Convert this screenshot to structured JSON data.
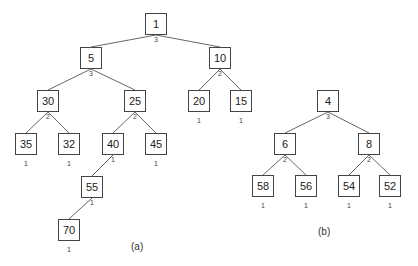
{
  "figures": [
    {
      "id": "a",
      "caption": "(a)",
      "caption_pos": [
        131,
        241
      ],
      "nodes": [
        {
          "key": "1",
          "rank": "3",
          "x": 145,
          "y": 13,
          "rank_pos": "below"
        },
        {
          "key": "5",
          "rank": "3",
          "x": 80,
          "y": 47,
          "rank_pos": "below"
        },
        {
          "key": "10",
          "rank": "2",
          "x": 209,
          "y": 47,
          "rank_pos": "below"
        },
        {
          "key": "30",
          "rank": "2",
          "x": 37,
          "y": 90,
          "rank_pos": "below"
        },
        {
          "key": "25",
          "rank": "2",
          "x": 124,
          "y": 90,
          "rank_pos": "below"
        },
        {
          "key": "20",
          "rank": "1",
          "x": 188,
          "y": 90,
          "rank_pos": "under"
        },
        {
          "key": "15",
          "rank": "1",
          "x": 230,
          "y": 90,
          "rank_pos": "under"
        },
        {
          "key": "35",
          "rank": "1",
          "x": 15,
          "y": 133,
          "rank_pos": "under"
        },
        {
          "key": "32",
          "rank": "1",
          "x": 58,
          "y": 133,
          "rank_pos": "under"
        },
        {
          "key": "40",
          "rank": "1",
          "x": 102,
          "y": 133,
          "rank_pos": "below"
        },
        {
          "key": "45",
          "rank": "1",
          "x": 145,
          "y": 133,
          "rank_pos": "under"
        },
        {
          "key": "55",
          "rank": "1",
          "x": 81,
          "y": 176,
          "rank_pos": "below"
        },
        {
          "key": "70",
          "rank": "1",
          "x": 58,
          "y": 219,
          "rank_pos": "under"
        }
      ],
      "edges": [
        [
          "1",
          "5"
        ],
        [
          "1",
          "10"
        ],
        [
          "5",
          "30"
        ],
        [
          "5",
          "25"
        ],
        [
          "10",
          "20"
        ],
        [
          "10",
          "15"
        ],
        [
          "30",
          "35"
        ],
        [
          "30",
          "32"
        ],
        [
          "25",
          "40"
        ],
        [
          "25",
          "45"
        ],
        [
          "40",
          "55"
        ],
        [
          "55",
          "70"
        ]
      ]
    },
    {
      "id": "b",
      "caption": "(b)",
      "caption_pos": [
        318,
        226
      ],
      "nodes": [
        {
          "key": "4",
          "rank": "3",
          "x": 317,
          "y": 90,
          "rank_pos": "below"
        },
        {
          "key": "6",
          "rank": "2",
          "x": 274,
          "y": 133,
          "rank_pos": "below"
        },
        {
          "key": "8",
          "rank": "2",
          "x": 358,
          "y": 133,
          "rank_pos": "below"
        },
        {
          "key": "58",
          "rank": "1",
          "x": 252,
          "y": 175,
          "rank_pos": "under"
        },
        {
          "key": "56",
          "rank": "1",
          "x": 295,
          "y": 175,
          "rank_pos": "under"
        },
        {
          "key": "54",
          "rank": "1",
          "x": 338,
          "y": 175,
          "rank_pos": "under"
        },
        {
          "key": "52",
          "rank": "1",
          "x": 379,
          "y": 175,
          "rank_pos": "under"
        }
      ],
      "edges": [
        [
          "4",
          "6"
        ],
        [
          "4",
          "8"
        ],
        [
          "6",
          "58"
        ],
        [
          "6",
          "56"
        ],
        [
          "8",
          "54"
        ],
        [
          "8",
          "52"
        ]
      ]
    }
  ]
}
